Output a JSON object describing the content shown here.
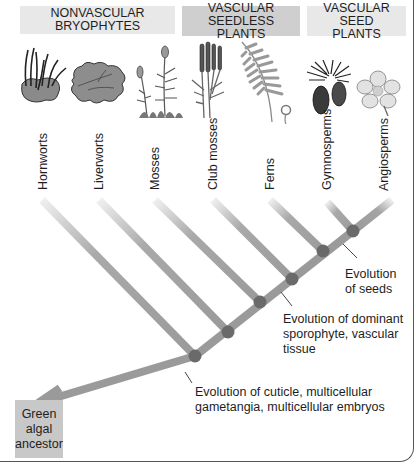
{
  "groups": [
    {
      "label": "NONVASCULAR BRYOPHYTES"
    },
    {
      "label": "VASCULAR SEEDLESS PLANTS"
    },
    {
      "label": "VASCULAR SEED PLANTS"
    }
  ],
  "taxa": [
    {
      "label": "Hornworts",
      "plant_icon": "hornwort-icon"
    },
    {
      "label": "Liverworts",
      "plant_icon": "liverwort-icon"
    },
    {
      "label": "Mosses",
      "plant_icon": "moss-icon"
    },
    {
      "label": "Club mosses",
      "plant_icon": "club-moss-icon"
    },
    {
      "label": "Ferns",
      "plant_icon": "fern-icon"
    },
    {
      "label": "Gymnosperms",
      "plant_icon": "pine-cone-icon"
    },
    {
      "label": "Angiosperms",
      "plant_icon": "flower-icon"
    }
  ],
  "annotations": {
    "seeds": "Evolution of seeds",
    "vascular": "Evolution of dominant sporophyte, vascular tissue",
    "cuticle": "Evolution of cuticle, multicellular gametangia, multicellular embryos"
  },
  "ancestor": {
    "label": "Green algal ancestor"
  },
  "colors": {
    "branch": "#9a9a9a",
    "node": "#6a6a6a",
    "header_light": "#e8e8e8",
    "header_dark": "#cfcfcf",
    "ancestor_box": "#c8c8c8"
  }
}
